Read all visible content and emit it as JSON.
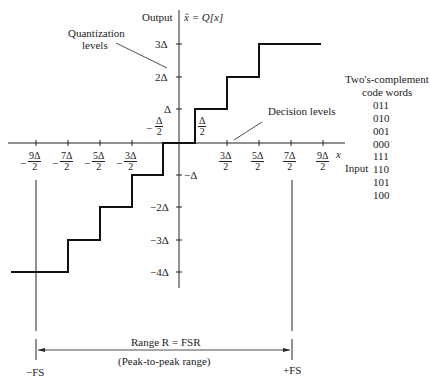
{
  "axes": {
    "output_label": "Output",
    "output_function": "x̂ = Q[x]",
    "input_symbol": "x",
    "input_label": "Input"
  },
  "y_ticks": [
    "3Δ",
    "2Δ",
    "Δ",
    "−Δ",
    "−2Δ",
    "−3Δ",
    "−4Δ"
  ],
  "x_ticks": [
    {
      "num": "9Δ",
      "den": "2",
      "sign": "−"
    },
    {
      "num": "7Δ",
      "den": "2",
      "sign": "−"
    },
    {
      "num": "5Δ",
      "den": "2",
      "sign": "−"
    },
    {
      "num": "3Δ",
      "den": "2",
      "sign": "−"
    },
    {
      "num": "Δ",
      "den": "2",
      "sign": "−"
    },
    {
      "num": "Δ",
      "den": "2",
      "sign": ""
    },
    {
      "num": "3Δ",
      "den": "2",
      "sign": ""
    },
    {
      "num": "5Δ",
      "den": "2",
      "sign": ""
    },
    {
      "num": "7Δ",
      "den": "2",
      "sign": ""
    },
    {
      "num": "9Δ",
      "den": "2",
      "sign": ""
    }
  ],
  "annotations": {
    "quantization_levels_line1": "Quantization",
    "quantization_levels_line2": "levels",
    "decision_levels": "Decision levels"
  },
  "code_words": {
    "title_line1": "Two's-complement",
    "title_line2": "code words",
    "values": [
      "011",
      "010",
      "001",
      "000",
      "111",
      "110",
      "101",
      "100"
    ]
  },
  "range": {
    "label": "Range R = FSR",
    "sublabel": "(Peak-to-peak range)",
    "left": "−FS",
    "right": "+FS"
  }
}
